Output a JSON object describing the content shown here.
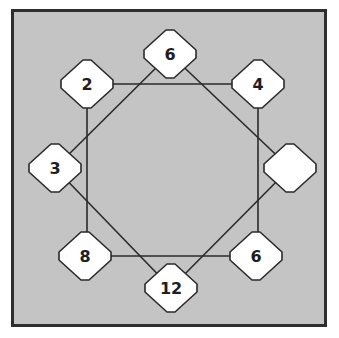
{
  "puzzle": {
    "background_color": "#c4c4c4",
    "border_color": "#2e2e2e",
    "line_color": "#2a2a2a",
    "node_fill": "#ffffff",
    "nodes": [
      {
        "id": "top",
        "label": "6",
        "cx": 170,
        "cy": 54
      },
      {
        "id": "top-left",
        "label": "2",
        "cx": 87,
        "cy": 84
      },
      {
        "id": "top-right",
        "label": "4",
        "cx": 258,
        "cy": 84
      },
      {
        "id": "left",
        "label": "3",
        "cx": 55,
        "cy": 168
      },
      {
        "id": "right",
        "label": "",
        "cx": 290,
        "cy": 168
      },
      {
        "id": "bottom-left",
        "label": "8",
        "cx": 85,
        "cy": 256
      },
      {
        "id": "bottom-right",
        "label": "6",
        "cx": 256,
        "cy": 256
      },
      {
        "id": "bottom",
        "label": "12",
        "cx": 171,
        "cy": 288
      }
    ],
    "square_connections": [
      "top-left",
      "top-right",
      "bottom-right",
      "bottom-left"
    ],
    "diamond_connections": [
      "top",
      "right",
      "bottom",
      "left"
    ]
  }
}
